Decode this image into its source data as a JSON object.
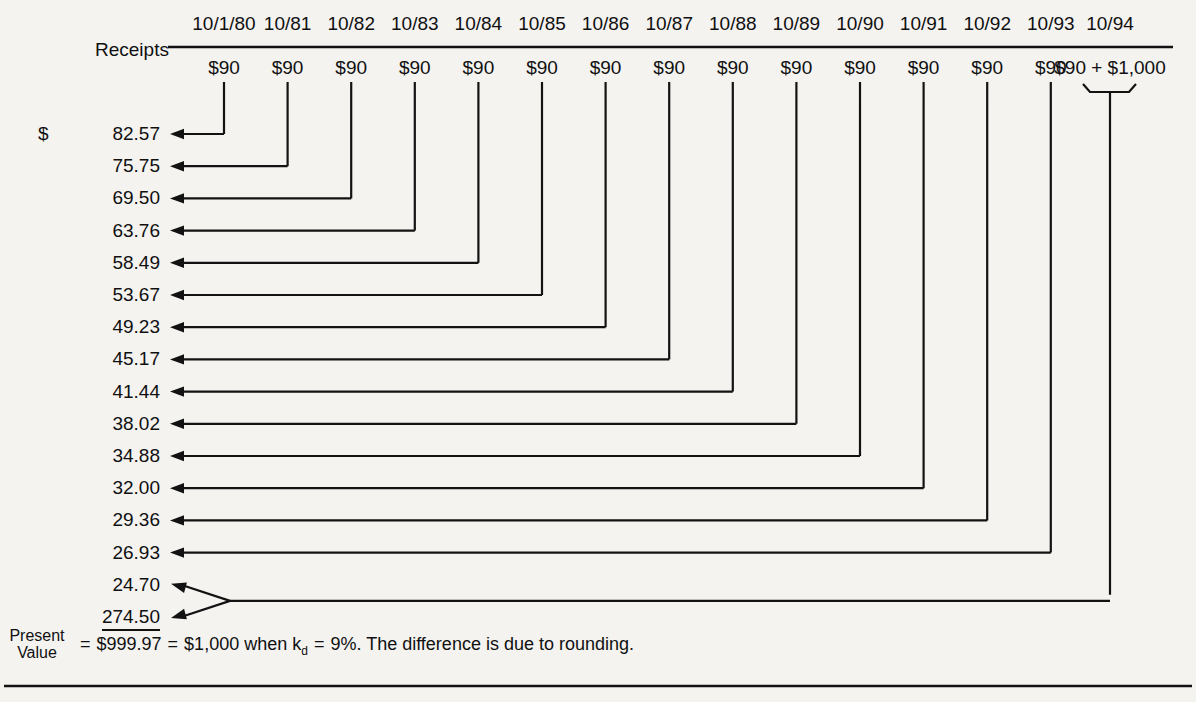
{
  "figure": {
    "row_label": "Receipts",
    "present_value_caption_line1": "Present",
    "present_value_caption_line2": "Value",
    "columns": [
      {
        "date": "10/1/80",
        "amount": "$90"
      },
      {
        "date": "10/81",
        "amount": "$90"
      },
      {
        "date": "10/82",
        "amount": "$90"
      },
      {
        "date": "10/83",
        "amount": "$90"
      },
      {
        "date": "10/84",
        "amount": "$90"
      },
      {
        "date": "10/85",
        "amount": "$90"
      },
      {
        "date": "10/86",
        "amount": "$90"
      },
      {
        "date": "10/87",
        "amount": "$90"
      },
      {
        "date": "10/88",
        "amount": "$90"
      },
      {
        "date": "10/89",
        "amount": "$90"
      },
      {
        "date": "10/90",
        "amount": "$90"
      },
      {
        "date": "10/91",
        "amount": "$90"
      },
      {
        "date": "10/92",
        "amount": "$90"
      },
      {
        "date": "10/93",
        "amount": "$90"
      },
      {
        "date": "10/94",
        "amount": "$90 + $1,000"
      }
    ],
    "present_values": [
      {
        "dollar": "$",
        "value": "82.57"
      },
      {
        "dollar": "",
        "value": "75.75"
      },
      {
        "dollar": "",
        "value": "69.50"
      },
      {
        "dollar": "",
        "value": "63.76"
      },
      {
        "dollar": "",
        "value": "58.49"
      },
      {
        "dollar": "",
        "value": "53.67"
      },
      {
        "dollar": "",
        "value": "49.23"
      },
      {
        "dollar": "",
        "value": "45.17"
      },
      {
        "dollar": "",
        "value": "41.44"
      },
      {
        "dollar": "",
        "value": "38.02"
      },
      {
        "dollar": "",
        "value": "34.88"
      },
      {
        "dollar": "",
        "value": "32.00"
      },
      {
        "dollar": "",
        "value": "29.36"
      },
      {
        "dollar": "",
        "value": "26.93"
      },
      {
        "dollar": "",
        "value": "24.70"
      },
      {
        "dollar": "",
        "value": "274.50"
      }
    ],
    "summary": {
      "equals_1": "=",
      "total": "$999.97",
      "equals_2": "=",
      "rounded_total": "$1,000",
      "when": "when",
      "rate_symbol": "k",
      "rate_subscript": "d",
      "equals_3": "=",
      "rate": "9%.",
      "note": "The difference is due to rounding."
    },
    "colors": {
      "ink": "#121212",
      "paper": "#f4f3f0"
    }
  },
  "chart_data": {
    "type": "diagram",
    "x": [
      "10/1/80",
      "10/81",
      "10/82",
      "10/83",
      "10/84",
      "10/85",
      "10/86",
      "10/87",
      "10/88",
      "10/89",
      "10/90",
      "10/91",
      "10/92",
      "10/93",
      "10/94",
      "10/94"
    ],
    "series": [
      {
        "name": "Cash receipt",
        "values": [
          90,
          90,
          90,
          90,
          90,
          90,
          90,
          90,
          90,
          90,
          90,
          90,
          90,
          90,
          90,
          1000
        ]
      },
      {
        "name": "Present value at 9%",
        "values": [
          82.57,
          75.75,
          69.5,
          63.76,
          58.49,
          53.67,
          49.23,
          45.17,
          41.44,
          38.02,
          34.88,
          32.0,
          29.36,
          26.93,
          24.7,
          274.5
        ]
      }
    ],
    "total_present_value": 999.97,
    "discount_rate": "9%",
    "face_value": 1000
  }
}
